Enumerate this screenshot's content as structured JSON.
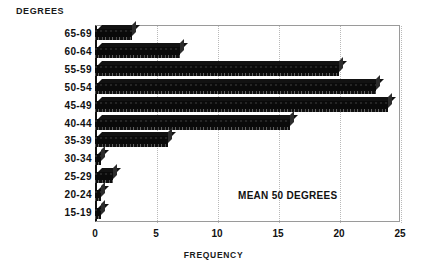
{
  "chart_data": {
    "type": "bar",
    "orientation": "horizontal",
    "title": "",
    "xlabel": "FREQUENCY",
    "ylabel": "DEGREES",
    "categories": [
      "65-69",
      "60-64",
      "55-59",
      "50-54",
      "45-49",
      "40-44",
      "35-39",
      "30-34",
      "25-29",
      "20-24",
      "15-19"
    ],
    "values": [
      3,
      7,
      20,
      23,
      24,
      16,
      6,
      0.5,
      1.5,
      0.5,
      0.5
    ],
    "xlim": [
      0,
      25
    ],
    "xticks": [
      0,
      5,
      10,
      15,
      20,
      25
    ],
    "grid": true,
    "legend": null,
    "annotations": [
      "MEAN 50 DEGREES"
    ],
    "bar_color": "#0a0a0a"
  },
  "axes": {
    "y_caption": "DEGREES",
    "x_caption": "FREQUENCY",
    "tick_labels": [
      "0",
      "5",
      "10",
      "15",
      "20",
      "25"
    ],
    "category_labels": [
      "65-69",
      "60-64",
      "55-59",
      "50-54",
      "45-49",
      "40-44",
      "35-39",
      "30-34",
      "25-29",
      "20-24",
      "15-19"
    ]
  },
  "annotation": {
    "mean_text": "MEAN 50 DEGREES"
  }
}
